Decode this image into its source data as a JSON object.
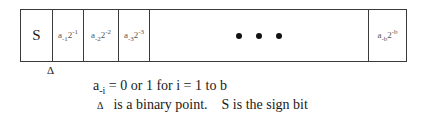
{
  "register": {
    "sign_label": "S",
    "terms": [
      {
        "coef": "a",
        "coef_sub": "-1",
        "base": "2",
        "exp": "-1"
      },
      {
        "coef": "a",
        "coef_sub": "-2",
        "base": "2",
        "exp": "-2"
      },
      {
        "coef": "a",
        "coef_sub": "-3",
        "base": "2",
        "exp": "-3"
      }
    ],
    "ellipsis": "• • •",
    "last_term": {
      "coef": "a",
      "coef_sub": "-b",
      "base": "2",
      "exp": "-b"
    }
  },
  "binary_point_marker": "Δ",
  "legend": {
    "line1_coef": "a",
    "line1_sub": "-i",
    "line1_rest": " = 0 or 1  for i = 1 to b",
    "line2_marker": "Δ",
    "line2_text_a": "is a binary point.",
    "line2_text_b": "S is the sign bit"
  }
}
